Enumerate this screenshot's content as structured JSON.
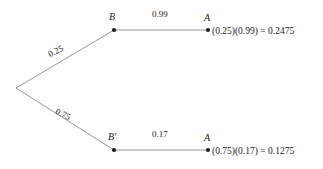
{
  "diagram": {
    "type": "probability-tree",
    "title": "",
    "line_color": "#8a8a8a",
    "node_color": "#1a1a1a",
    "text_color": "#1a1a1a",
    "background": "#ffffff",
    "root": {
      "label": ""
    },
    "branches": [
      {
        "id": "upper",
        "first_prob": "0.25",
        "first_node_label": "B",
        "second_prob": "0.99",
        "second_node_label": "A",
        "result": "(0.25)(0.99) = 0.2475"
      },
      {
        "id": "lower",
        "first_prob": "0.75",
        "first_node_label": "B'",
        "second_prob": "0.17",
        "second_node_label": "A",
        "result": "(0.75)(0.17) = 0.1275"
      }
    ]
  },
  "geometry": {
    "root_x": 16,
    "root_y": 88,
    "upper_mid_x": 114,
    "upper_mid_y": 30,
    "upper_end_x": 208,
    "upper_end_y": 30,
    "lower_mid_x": 114,
    "lower_mid_y": 150,
    "lower_end_x": 208,
    "lower_end_y": 150
  }
}
